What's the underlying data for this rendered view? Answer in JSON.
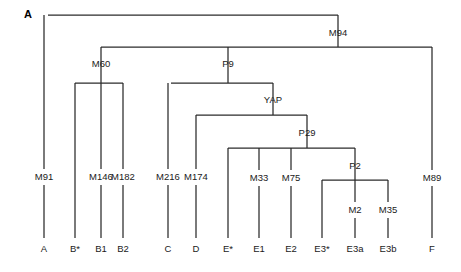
{
  "figure": {
    "panel_label": "A",
    "panel_label_x": 28,
    "panel_label_y": 15,
    "width": 461,
    "height": 272,
    "line_color": "#2b2b2b",
    "text_color": "#1a1a1a",
    "background": "#ffffff"
  },
  "chart_data": {
    "type": "tree",
    "title": "",
    "internal_nodes": [
      {
        "name": "M94",
        "x": 338,
        "y": 33,
        "bar_y": 47,
        "bar_x1": 101,
        "bar_x2": 432,
        "stem_y1": 15,
        "stem_y2": 47
      },
      {
        "name": "M60",
        "x": 101,
        "y": 64,
        "bar_y": 83,
        "bar_x1": 75,
        "bar_x2": 123,
        "stem_y1": 47,
        "stem_y2": 83
      },
      {
        "name": "P9",
        "x": 228,
        "y": 64,
        "bar_y": 83,
        "bar_x1": 171,
        "bar_x2": 273,
        "stem_y1": 47,
        "stem_y2": 83
      },
      {
        "name": "YAP",
        "x": 273,
        "y": 100,
        "bar_y": 115,
        "bar_x1": 196,
        "bar_x2": 307,
        "stem_y1": 83,
        "stem_y2": 115
      },
      {
        "name": "P29",
        "x": 307,
        "y": 133,
        "bar_y": 148,
        "bar_x1": 228,
        "bar_x2": 355,
        "stem_y1": 115,
        "stem_y2": 148
      },
      {
        "name": "P2",
        "x": 355,
        "y": 166,
        "bar_y": 180,
        "bar_x1": 322,
        "bar_x2": 388,
        "stem_y1": 148,
        "stem_y2": 180
      }
    ],
    "root": {
      "x": 48,
      "bar_y": 15,
      "bar_x1": 48,
      "bar_x2": 338
    },
    "leaves": [
      {
        "label": "A",
        "x": 44,
        "mutation": "M91",
        "mutation_y": 177,
        "top_y": 15,
        "bottom_y": 238
      },
      {
        "label": "B*",
        "x": 75,
        "mutation": "",
        "mutation_y": 177,
        "top_y": 83,
        "bottom_y": 238
      },
      {
        "label": "B1",
        "x": 101,
        "mutation": "M146",
        "mutation_y": 177,
        "top_y": 83,
        "bottom_y": 238
      },
      {
        "label": "B2",
        "x": 123,
        "mutation": "M182",
        "mutation_y": 177,
        "top_y": 83,
        "bottom_y": 238
      },
      {
        "label": "C",
        "x": 168,
        "mutation": "M216",
        "mutation_y": 177,
        "top_y": 83,
        "bottom_y": 238
      },
      {
        "label": "D",
        "x": 196,
        "mutation": "M174",
        "mutation_y": 177,
        "top_y": 115,
        "bottom_y": 238
      },
      {
        "label": "E*",
        "x": 228,
        "mutation": "",
        "mutation_y": 177,
        "top_y": 148,
        "bottom_y": 238
      },
      {
        "label": "E1",
        "x": 259,
        "mutation": "M33",
        "mutation_y": 178,
        "top_y": 148,
        "bottom_y": 238
      },
      {
        "label": "E2",
        "x": 291,
        "mutation": "M75",
        "mutation_y": 178,
        "top_y": 148,
        "bottom_y": 238
      },
      {
        "label": "E3*",
        "x": 322,
        "mutation": "",
        "mutation_y": 210,
        "top_y": 180,
        "bottom_y": 238
      },
      {
        "label": "E3a",
        "x": 355,
        "mutation": "M2",
        "mutation_y": 210,
        "top_y": 180,
        "bottom_y": 238
      },
      {
        "label": "E3b",
        "x": 388,
        "mutation": "M35",
        "mutation_y": 210,
        "top_y": 180,
        "bottom_y": 238
      },
      {
        "label": "F",
        "x": 432,
        "mutation": "M89",
        "mutation_y": 178,
        "top_y": 47,
        "bottom_y": 238
      }
    ],
    "leaf_label_y": 249,
    "xlabel": "",
    "ylabel": ""
  }
}
